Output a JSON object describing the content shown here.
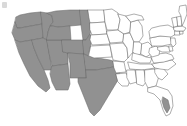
{
  "figure": {
    "title": "United States map with western region highlighted",
    "background_color": "#ffffff",
    "width": 187,
    "height": 126
  },
  "legend": {
    "shaded_label": "Highlighted states",
    "shaded_color": "#919191",
    "unshaded_label": "Other states",
    "unshaded_color": "#ffffff",
    "border_color": "#6b6b6b"
  },
  "map_data": {
    "type": "choropleth",
    "region": "United States (contiguous 48)",
    "projection": "albers-usa",
    "categories": [
      "shaded",
      "unshaded"
    ],
    "shaded_states": [
      "Washington",
      "Oregon",
      "California",
      "Idaho",
      "Nevada",
      "Utah",
      "Arizona",
      "Montana",
      "Wyoming",
      "Colorado",
      "New Mexico",
      "Texas",
      "Oklahoma",
      "western Dakotas",
      "western Nebraska",
      "western Kansas"
    ],
    "unshaded_states": [
      "North Dakota",
      "South Dakota",
      "Nebraska",
      "Kansas",
      "Minnesota",
      "Iowa",
      "Missouri",
      "Arkansas",
      "Louisiana",
      "Wisconsin",
      "Illinois",
      "Michigan",
      "Indiana",
      "Ohio",
      "Kentucky",
      "Tennessee",
      "Mississippi",
      "Alabama",
      "Georgia",
      "Florida",
      "South Carolina",
      "North Carolina",
      "Virginia",
      "West Virginia",
      "Maryland",
      "Delaware",
      "Pennsylvania",
      "New Jersey",
      "New York",
      "Connecticut",
      "Rhode Island",
      "Massachusetts",
      "Vermont",
      "New Hampshire",
      "Maine"
    ]
  }
}
